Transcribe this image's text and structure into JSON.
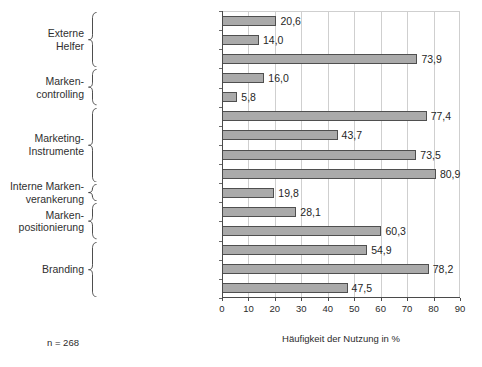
{
  "chart_data": {
    "type": "bar",
    "orientation": "horizontal",
    "title": "",
    "xlabel": "Häufigkeit der Nutzung in %",
    "ylabel": "",
    "xlim": [
      0,
      90
    ],
    "xticks": [
      0,
      10,
      20,
      30,
      40,
      50,
      60,
      70,
      80,
      90
    ],
    "grid": true,
    "legend": false,
    "annotation": "n = 268",
    "bar_color": "#aaaaaa",
    "bar_edge_color": "#4f4f4f",
    "decimal_separator": ",",
    "categories": [
      "Zus. mit Marktforschungsunternehmen",
      "Zus. mit Markenberater",
      "Zus. mit Werbeagentur",
      "Marken-Image-Messung",
      "Markenwertermittlung",
      "Imagebroschüre",
      "Imagewerbung",
      "Markenpräs. auf der Messe",
      "Markenpräs. im Internet",
      "Schulung der Mitarbeiter",
      "Schriftliche Markenpositionierung",
      "CD-Richtlinien",
      "Slogan/Claim",
      "Markenfarbe",
      "Bildlogo"
    ],
    "values": [
      20.6,
      14.0,
      73.9,
      16.0,
      5.8,
      77.4,
      43.7,
      73.5,
      80.9,
      19.8,
      28.1,
      60.3,
      54.9,
      78.2,
      47.5
    ],
    "value_labels": [
      "20,6",
      "14,0",
      "73,9",
      "16,0",
      "5,8",
      "77,4",
      "43,7",
      "73,5",
      "80,9",
      "19,8",
      "28,1",
      "60,3",
      "54,9",
      "78,2",
      "47,5"
    ],
    "groups": [
      {
        "label": "Externe\nHelfer",
        "start": 0,
        "end": 2
      },
      {
        "label": "Marken-\ncontrolling",
        "start": 3,
        "end": 4
      },
      {
        "label": "Marketing-\nInstrumente",
        "start": 5,
        "end": 8
      },
      {
        "label": "Interne Marken-\nverankerung",
        "start": 9,
        "end": 9
      },
      {
        "label": "Marken-\npositionierung",
        "start": 10,
        "end": 11
      },
      {
        "label": "Branding",
        "start": 12,
        "end": 14
      }
    ]
  }
}
